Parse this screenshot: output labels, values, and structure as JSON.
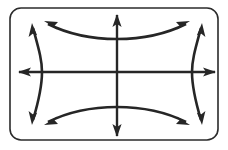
{
  "figure": {
    "name": "conjugate-hyperbolas-diagram",
    "background_color": "#ffffff",
    "frame": {
      "stroke_color": "#2b2b2b",
      "stroke_width": 1.6,
      "corner_radius": 11,
      "x": 10,
      "y": 8,
      "width": 208,
      "height": 132
    },
    "center": {
      "x": 117,
      "y": 72
    },
    "stroke_color": "#262626",
    "axes": [
      {
        "name": "vertical-axis",
        "orientation": "vertical",
        "from": {
          "x": 117,
          "y": 15
        },
        "to": {
          "x": 117,
          "y": 136
        },
        "stroke_width": 2.4,
        "arrows": [
          "start",
          "end"
        ]
      },
      {
        "name": "horizontal-axis",
        "orientation": "horizontal",
        "from": {
          "x": 19,
          "y": 72
        },
        "to": {
          "x": 215,
          "y": 72
        },
        "stroke_width": 2.4,
        "arrows": [
          "start",
          "end"
        ]
      }
    ],
    "curves": [
      {
        "name": "upper-branch",
        "label": "upper branch of vertical hyperbola",
        "vertex": {
          "x": 117,
          "y": 39
        },
        "path": "M 48 24 C 72 36 96 39 117 39 C 138 39 162 36 186 24",
        "stroke_width": 2.6,
        "arrows": [
          "start",
          "end"
        ]
      },
      {
        "name": "lower-branch",
        "label": "lower branch of vertical hyperbola",
        "vertex": {
          "x": 117,
          "y": 107
        },
        "path": "M 48 122 C 72 110 96 107 117 107 C 138 107 162 110 186 122",
        "stroke_width": 2.6,
        "arrows": [
          "start",
          "end"
        ]
      },
      {
        "name": "left-branch",
        "label": "left branch of horizontal hyperbola",
        "vertex": {
          "x": 42,
          "y": 72
        },
        "path": "M 33 28 C 39 50 42 60 42 72 C 42 84 39 100 33 120",
        "stroke_width": 2.6,
        "arrows": [
          "start",
          "end"
        ]
      },
      {
        "name": "right-branch",
        "label": "right branch of horizontal hyperbola",
        "vertex": {
          "x": 192,
          "y": 72
        },
        "path": "M 201 28 C 195 50 192 60 192 72 C 192 84 195 100 201 120",
        "stroke_width": 2.6,
        "arrows": [
          "start",
          "end"
        ]
      }
    ],
    "arrowheads": [
      {
        "name": "axis-arrow-up",
        "points": "117,14 112.4,27 117,24 121.6,27"
      },
      {
        "name": "axis-arrow-down",
        "points": "117,137 112.4,124 117,127 121.6,124"
      },
      {
        "name": "axis-arrow-left",
        "points": "18,72 31,67.4 28,72 31,76.6"
      },
      {
        "name": "axis-arrow-right",
        "points": "216,72 203,67.4 206,72 203,76.6"
      },
      {
        "name": "curve-arrow-top-left",
        "points": "44,21 58,22 54.5,25.8 57.2,29.4"
      },
      {
        "name": "curve-arrow-top-right",
        "points": "190,21 176,22 179.5,25.8 176.8,29.4"
      },
      {
        "name": "curve-arrow-bottom-left",
        "points": "44,125 58,124 54.5,120.2 57.2,116.6"
      },
      {
        "name": "curve-arrow-bottom-right",
        "points": "190,125 176,124 179.5,120.2 176.8,116.6"
      },
      {
        "name": "curve-arrow-left-up",
        "points": "32,23 28.6,37 32.6,33.8 37.1,35.2"
      },
      {
        "name": "curve-arrow-left-down",
        "points": "32,125 28.6,111 32.6,114.2 37.1,112.8"
      },
      {
        "name": "curve-arrow-right-up",
        "points": "202,23 205.4,37 201.4,33.8 196.9,35.2"
      },
      {
        "name": "curve-arrow-right-down",
        "points": "202,125 205.4,111 201.4,114.2 196.9,112.8"
      }
    ]
  }
}
